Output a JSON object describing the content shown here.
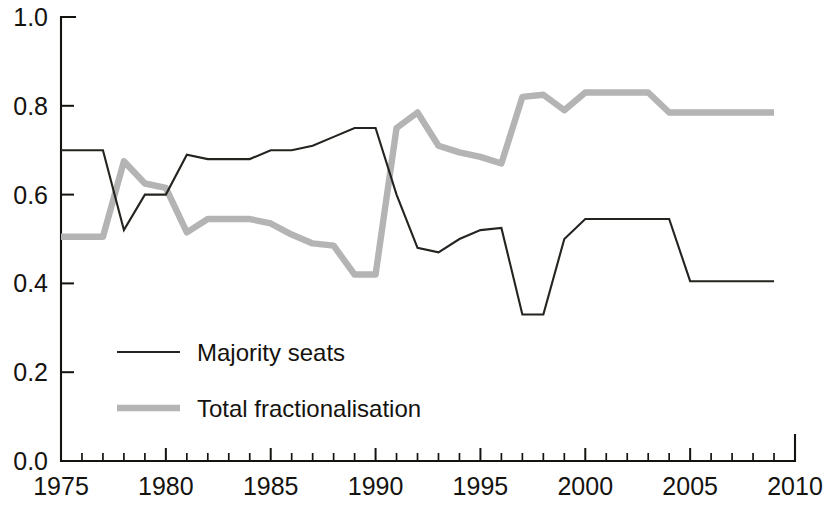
{
  "chart_data": {
    "type": "line",
    "title": "",
    "subtitle": "",
    "xlabel": "",
    "ylabel": "",
    "xlim": [
      1975,
      2010
    ],
    "ylim": [
      0.0,
      1.0
    ],
    "grid": false,
    "legend_position": "inside-lower-left",
    "x_tick_labels": [
      "1975",
      "1980",
      "1985",
      "1990",
      "1995",
      "2000",
      "2005",
      "2010"
    ],
    "x_major_ticks": [
      1975,
      1980,
      1985,
      1990,
      1995,
      2000,
      2005,
      2010
    ],
    "x_minor_tick_interval": 1,
    "y_tick_labels": [
      "0.0",
      "0.2",
      "0.4",
      "0.6",
      "0.8",
      "1.0"
    ],
    "y_major_ticks": [
      0.0,
      0.2,
      0.4,
      0.6,
      0.8,
      1.0
    ],
    "x": [
      1975,
      1976,
      1977,
      1978,
      1979,
      1980,
      1981,
      1982,
      1983,
      1984,
      1985,
      1986,
      1987,
      1988,
      1989,
      1990,
      1991,
      1992,
      1993,
      1994,
      1995,
      1996,
      1997,
      1998,
      1999,
      2000,
      2001,
      2002,
      2003,
      2004,
      2005,
      2006,
      2007,
      2008,
      2009
    ],
    "series": [
      {
        "name": "Majority seats",
        "color": "#25231f",
        "style": "thin-solid",
        "values": [
          0.7,
          0.7,
          0.7,
          0.52,
          0.6,
          0.6,
          0.69,
          0.68,
          0.68,
          0.68,
          0.7,
          0.7,
          0.71,
          0.73,
          0.75,
          0.75,
          0.6,
          0.48,
          0.47,
          0.5,
          0.52,
          0.525,
          0.33,
          0.33,
          0.5,
          0.545,
          0.545,
          0.545,
          0.545,
          0.545,
          0.405,
          0.405,
          0.405,
          0.405,
          0.405
        ]
      },
      {
        "name": "Total fractionalisation",
        "color": "#b4b4b4",
        "style": "thick-solid",
        "values": [
          0.505,
          0.505,
          0.505,
          0.675,
          0.625,
          0.615,
          0.515,
          0.545,
          0.545,
          0.545,
          0.535,
          0.51,
          0.49,
          0.485,
          0.42,
          0.42,
          0.75,
          0.785,
          0.71,
          0.695,
          0.685,
          0.67,
          0.82,
          0.825,
          0.79,
          0.83,
          0.83,
          0.83,
          0.83,
          0.785,
          0.785,
          0.785,
          0.785,
          0.785,
          0.785
        ]
      }
    ]
  },
  "legend": {
    "items": [
      {
        "label": "Majority seats",
        "swatch": "thin-line-swatch"
      },
      {
        "label": "Total fractionalisation",
        "swatch": "thick-line-swatch"
      }
    ]
  }
}
